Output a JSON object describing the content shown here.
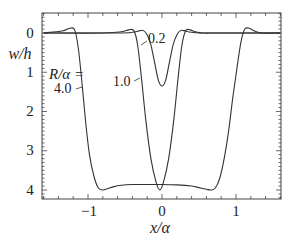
{
  "chart_data": {
    "type": "line",
    "title": "",
    "xlabel": "x/α",
    "ylabel": "w/h",
    "xlim": [
      -1.6,
      1.6
    ],
    "ylim": [
      -0.45,
      4.2
    ],
    "y_inverted": true,
    "xticks": [
      -1,
      0,
      1
    ],
    "xtick_labels": [
      "−1",
      "0",
      "1"
    ],
    "yticks": [
      0,
      1,
      2,
      3,
      4
    ],
    "ytick_labels": [
      "0",
      "1",
      "2",
      "3",
      "4"
    ],
    "grid": false,
    "legend": null,
    "annotations": [
      {
        "text": "R/α =",
        "target": "4.0"
      },
      {
        "text": "4.0",
        "series": "R/α = 4.0"
      },
      {
        "text": "1.0",
        "series": "R/α = 1.0"
      },
      {
        "text": "0.2",
        "series": "R/α = 0.2"
      }
    ],
    "series": [
      {
        "name": "R/α = 0.2",
        "x": [
          -1.6,
          -0.6,
          -0.4,
          -0.3,
          -0.25,
          -0.2,
          -0.15,
          -0.1,
          -0.05,
          0.0,
          0.05,
          0.1,
          0.15,
          0.2,
          0.25,
          0.3,
          0.4,
          0.6,
          1.6
        ],
        "y": [
          0.0,
          0.0,
          -0.02,
          -0.06,
          -0.06,
          0.05,
          0.3,
          0.75,
          1.2,
          1.35,
          1.2,
          0.75,
          0.3,
          0.05,
          -0.06,
          -0.06,
          -0.02,
          0.0,
          0.0
        ]
      },
      {
        "name": "R/α = 1.0",
        "x": [
          -1.6,
          -0.8,
          -0.55,
          -0.45,
          -0.38,
          -0.33,
          -0.28,
          -0.22,
          -0.15,
          -0.08,
          -0.03,
          0.02,
          0.09,
          0.16,
          0.22,
          0.27,
          0.32,
          0.38,
          0.45,
          0.55,
          0.8,
          1.6
        ],
        "y": [
          0.0,
          0.0,
          -0.03,
          -0.08,
          -0.06,
          0.3,
          1.1,
          2.2,
          3.2,
          3.8,
          4.0,
          3.8,
          3.2,
          2.2,
          1.1,
          0.3,
          -0.06,
          -0.08,
          -0.03,
          0.0,
          0.0,
          0.0
        ]
      },
      {
        "name": "R/α = 4.0",
        "x": [
          -1.6,
          -1.35,
          -1.25,
          -1.18,
          -1.13,
          -1.08,
          -1.03,
          -0.98,
          -0.92,
          -0.86,
          -0.8,
          -0.74,
          -0.66,
          -0.55,
          -0.4,
          -0.2,
          0.0,
          0.2,
          0.4,
          0.5,
          0.6,
          0.66,
          0.72,
          0.78,
          0.84,
          0.9,
          0.96,
          1.02,
          1.07,
          1.12,
          1.18,
          1.25,
          1.35,
          1.6
        ],
        "y": [
          0.0,
          -0.05,
          -0.12,
          -0.08,
          0.4,
          1.3,
          2.3,
          3.1,
          3.65,
          3.95,
          4.0,
          3.97,
          3.92,
          3.88,
          3.86,
          3.86,
          3.86,
          3.87,
          3.9,
          3.94,
          3.98,
          4.0,
          3.95,
          3.7,
          3.2,
          2.5,
          1.6,
          0.8,
          0.2,
          -0.1,
          -0.12,
          -0.05,
          0.0,
          0.0
        ]
      }
    ]
  }
}
